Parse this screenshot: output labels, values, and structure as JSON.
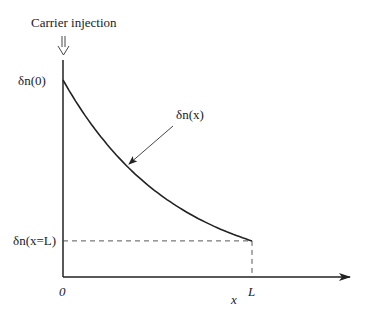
{
  "title": "Carrier injection",
  "labels": {
    "delta_n0": "δn(0)",
    "delta_nL": "δn(x=L)",
    "curve": "δn(x)",
    "origin": "0",
    "L": "L",
    "x_axis": "x"
  },
  "chart_data": {
    "type": "line",
    "title": "Carrier injection",
    "xlabel": "x",
    "ylabel": "",
    "x_ticks": [
      "0",
      "L"
    ],
    "y_ticks": [
      "δn(0)",
      "δn(x=L)"
    ],
    "series": [
      {
        "name": "δn(x)",
        "description": "exponential decay from δn(0) at x=0 to δn(x=L) at x=L",
        "x": [
          0,
          0.1,
          0.2,
          0.3,
          0.4,
          0.5,
          0.6,
          0.7,
          0.8,
          0.9,
          1.0
        ],
        "values": [
          1.0,
          0.842,
          0.71,
          0.598,
          0.504,
          0.425,
          0.358,
          0.302,
          0.254,
          0.214,
          0.183
        ]
      }
    ],
    "xlim": [
      0,
      1.5
    ],
    "ylim": [
      0,
      1.0
    ],
    "grid": false,
    "annotations": [
      {
        "text": "δn(x)",
        "type": "arrow-to-curve"
      },
      {
        "text": "δn(x=L)",
        "type": "dashed-reference-lines"
      }
    ]
  }
}
